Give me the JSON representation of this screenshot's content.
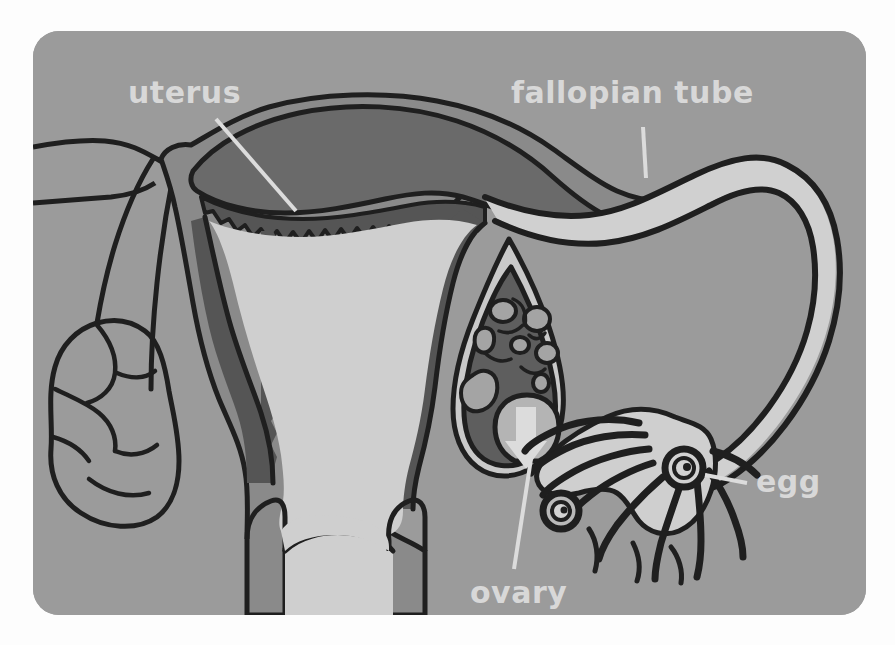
{
  "meta": {
    "kind": "anatomical-illustration",
    "view": "coronal cross-section of uterus, fallopian tubes and ovaries",
    "background_color": "#9b9b9b",
    "page_color": "#fdfdfd",
    "card": {
      "left": 33,
      "top": 31,
      "width": 833,
      "height": 584,
      "corner_radius": 26
    }
  },
  "palette": {
    "page": "#fdfdfd",
    "card_background": "#9b9b9b",
    "label_text": "#d8d8d8",
    "leader_line": "#dcdcdc",
    "outline_dark": "#1f1f1f",
    "myometrium_mid": "#8a8a8a",
    "myometrium_dark": "#6a6a6a",
    "endometrium_dark": "#555555",
    "cavity_light": "#cfcfcf",
    "tube_lumen_light": "#d0d0d0",
    "ovary_stroma_dark": "#5e5e5e",
    "ovary_capsule_light": "#c9c9c9",
    "follicle_light": "#a4a4a4",
    "arrow_light": "#dcdcdc",
    "fimbriae_light": "#cfcfcf"
  },
  "labels": [
    {
      "id": "uterus",
      "text": "uterus",
      "x": 95,
      "y": 72,
      "font_size": 30,
      "anchor": "start",
      "leader": {
        "x1": 183,
        "y1": 88,
        "x2": 263,
        "y2": 180,
        "width": 4
      }
    },
    {
      "id": "fallopian-tube",
      "text": "fallopian tube",
      "x": 478,
      "y": 72,
      "font_size": 30,
      "anchor": "start",
      "leader": {
        "x1": 610,
        "y1": 96,
        "x2": 613,
        "y2": 147,
        "width": 4
      }
    },
    {
      "id": "egg",
      "text": "egg",
      "x": 723,
      "y": 461,
      "font_size": 30,
      "anchor": "start",
      "leader": {
        "x1": 672,
        "y1": 444,
        "x2": 714,
        "y2": 452,
        "width": 4
      }
    },
    {
      "id": "ovary",
      "text": "ovary",
      "x": 437,
      "y": 572,
      "font_size": 30,
      "anchor": "start",
      "leader": {
        "x1": 498,
        "y1": 428,
        "x2": 481,
        "y2": 538,
        "width": 4
      }
    }
  ],
  "structures": [
    {
      "id": "uterus-body",
      "name": "uterus",
      "description": "central pear-shaped organ with thick muscular wall"
    },
    {
      "id": "endometrium",
      "name": "endometrium",
      "description": "dark lining layer with jagged inner border"
    },
    {
      "id": "uterine-cavity",
      "name": "uterine cavity",
      "description": "light triangular interior space"
    },
    {
      "id": "cervix",
      "name": "cervix",
      "description": "narrow lower uterine segment"
    },
    {
      "id": "vagina",
      "name": "vagina",
      "description": "light canal below cervix"
    },
    {
      "id": "fallopian-tube-right",
      "name": "right fallopian tube",
      "description": "long looping light tube arching over the right ovary"
    },
    {
      "id": "fallopian-tube-left",
      "name": "left fallopian tube",
      "description": "tube running to the left ovary"
    },
    {
      "id": "ovary-right",
      "name": "right ovary",
      "description": "dark stroma with light follicles and a rupturing follicle releasing an egg"
    },
    {
      "id": "ovary-left",
      "name": "left ovary",
      "description": "lobed outline ovary on the left side"
    },
    {
      "id": "fimbriae",
      "name": "fimbriae",
      "description": "finger-like projections at the end of the fallopian tube"
    },
    {
      "id": "egg-released",
      "name": "released egg",
      "description": "ring-shaped ovum below the ruptured follicle"
    },
    {
      "id": "egg-in-fimbriae",
      "name": "egg captured by fimbriae",
      "description": "ring-shaped ovum within the fimbrial funnel"
    },
    {
      "id": "ovulation-arrow",
      "name": "ovulation arrow",
      "description": "light downward arrow showing egg release from the ovary"
    }
  ]
}
